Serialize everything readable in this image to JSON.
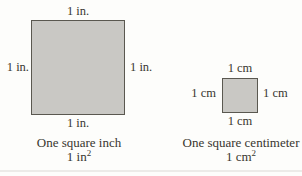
{
  "inch": {
    "side_labels": {
      "top": "1 in.",
      "left": "1 in.",
      "right": "1 in.",
      "bottom": "1 in."
    },
    "caption": "One square inch",
    "formula_base": "1 in",
    "formula_exp": "2"
  },
  "cm": {
    "side_labels": {
      "top": "1 cm",
      "left": "1 cm",
      "right": "1 cm",
      "bottom": "1 cm"
    },
    "caption": "One square centimeter",
    "formula_base": "1 cm",
    "formula_exp": "2"
  },
  "colors": {
    "square_fill": "#c9c8c4",
    "square_border": "#5a5850",
    "text": "#38362f",
    "background": "#fdfdfb"
  }
}
